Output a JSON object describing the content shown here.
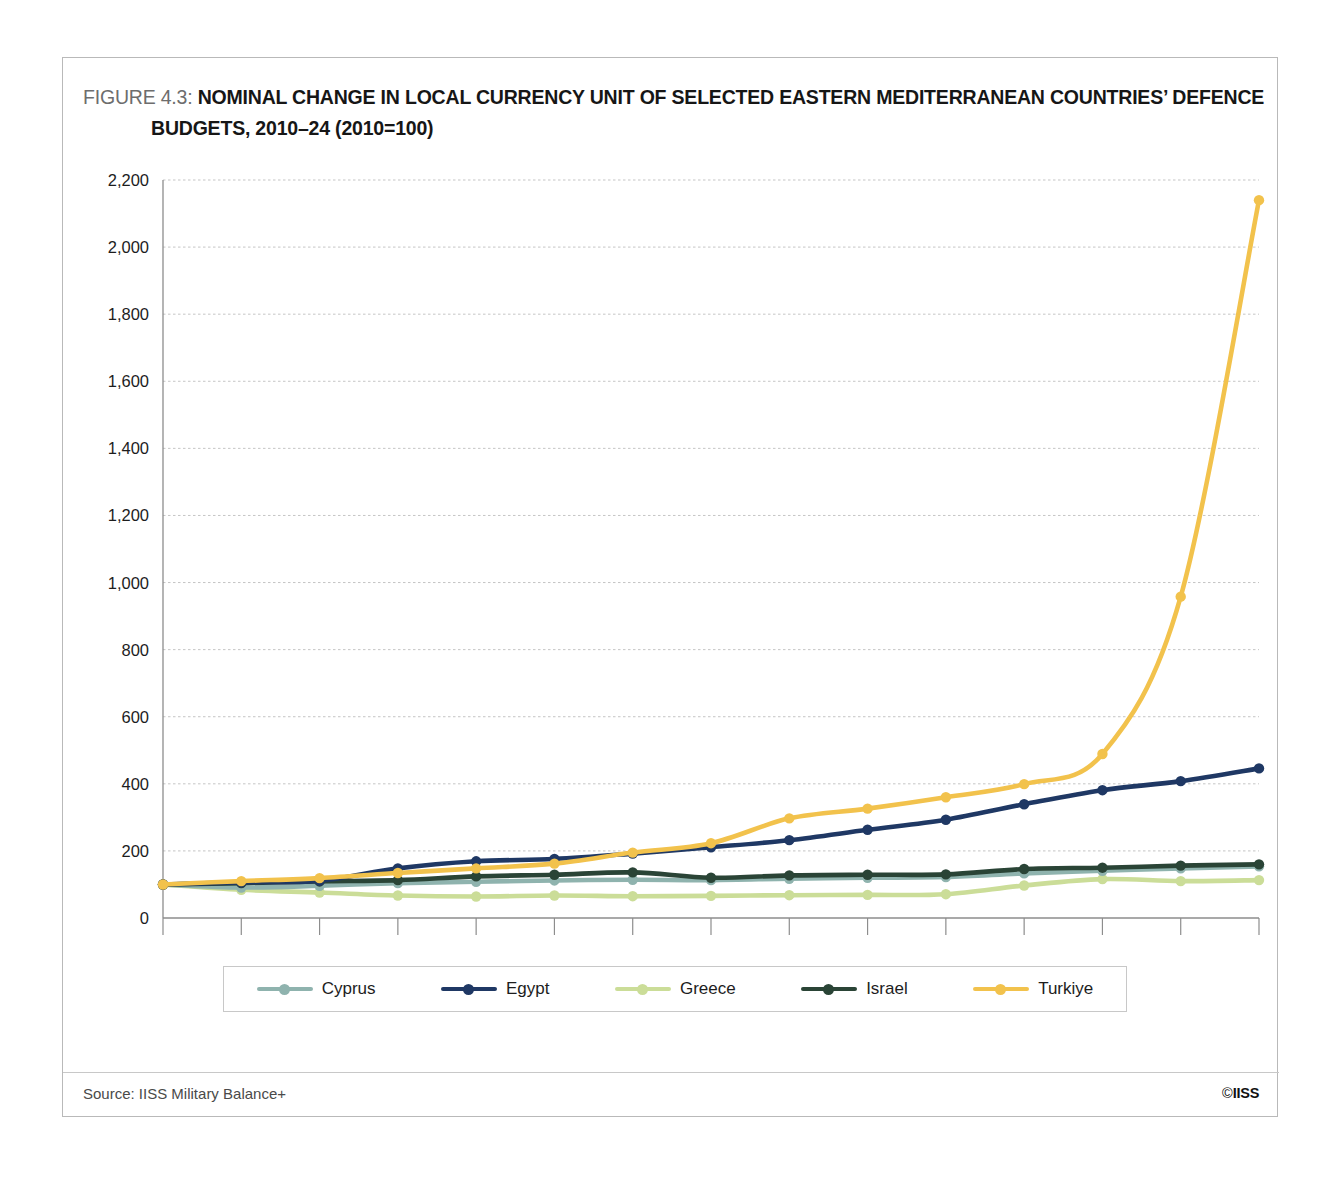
{
  "figure": {
    "number_label": "FIGURE 4.3:",
    "title_line_1": "NOMINAL CHANGE IN LOCAL CURRENCY UNIT OF SELECTED EASTERN MEDITERRANEAN COUNTRIES’ DEFENCE",
    "title_line_2": "BUDGETS, 2010–24 (2010=100)"
  },
  "footer": {
    "source": "Source: IISS Military Balance+",
    "copyright_symbol": "©",
    "copyright_org": "IISS"
  },
  "chart_data": {
    "type": "line",
    "title": "NOMINAL CHANGE IN LOCAL CURRENCY UNIT OF SELECTED EASTERN MEDITERRANEAN COUNTRIES’ DEFENCE BUDGETS, 2010–24 (2010=100)",
    "xlabel": "",
    "ylabel": "",
    "x": [
      2010,
      2011,
      2012,
      2013,
      2014,
      2015,
      2016,
      2017,
      2018,
      2019,
      2020,
      2021,
      2022,
      2023,
      2024
    ],
    "xtick_labels": [
      "2010",
      "2011",
      "2012",
      "2013",
      "2014",
      "2015",
      "2016",
      "2017",
      "2018",
      "2019",
      "2020",
      "2021",
      "2022",
      "2023",
      "2024"
    ],
    "ytick_labels": [
      "0",
      "200",
      "400",
      "600",
      "800",
      "1,000",
      "1,200",
      "1,400",
      "1,600",
      "1,800",
      "2,000",
      "2,200"
    ],
    "yticks": [
      0,
      200,
      400,
      600,
      800,
      1000,
      1200,
      1400,
      1600,
      1800,
      2000,
      2200
    ],
    "ylim": [
      0,
      2200
    ],
    "grid": true,
    "legend_position": "bottom",
    "series": [
      {
        "name": "Cyprus",
        "color": "#8fb3ae",
        "values": [
          100,
          91,
          96,
          104,
          108,
          112,
          114,
          113,
          117,
          120,
          122,
          133,
          141,
          148,
          154
        ]
      },
      {
        "name": "Egypt",
        "color": "#1f3864",
        "values": [
          100,
          106,
          111,
          148,
          169,
          176,
          192,
          211,
          232,
          263,
          293,
          339,
          381,
          408,
          446
        ]
      },
      {
        "name": "Greece",
        "color": "#cbdd98",
        "values": [
          100,
          84,
          76,
          67,
          64,
          67,
          65,
          66,
          68,
          69,
          71,
          97,
          116,
          110,
          113
        ]
      },
      {
        "name": "Israel",
        "color": "#2a4436",
        "values": [
          100,
          104,
          109,
          113,
          124,
          129,
          136,
          120,
          127,
          129,
          130,
          146,
          150,
          156,
          160
        ]
      },
      {
        "name": "Turkiye",
        "color": "#f2c24c",
        "values": [
          100,
          110,
          119,
          134,
          148,
          162,
          195,
          223,
          297,
          326,
          360,
          399,
          489,
          958,
          2140
        ]
      }
    ]
  }
}
